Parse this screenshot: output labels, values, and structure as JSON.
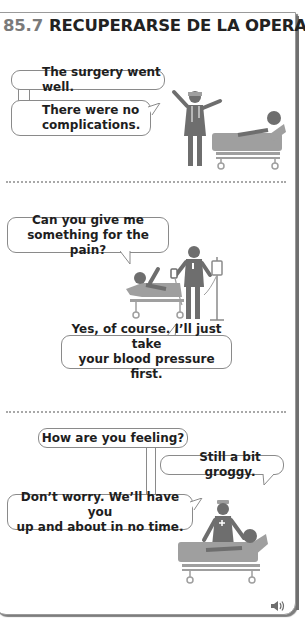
{
  "header": {
    "section_number": "85.7",
    "title": "RECUPERARSE DE LA OPERACIÓN"
  },
  "scenes": [
    {
      "bubbles": [
        {
          "text": "The surgery went well.",
          "speaker": "doctor"
        },
        {
          "text": "There were no complications.",
          "line1": "There were no",
          "line2": "complications.",
          "speaker": "doctor"
        }
      ],
      "illustration": "doctor-and-patient-in-bed"
    },
    {
      "bubbles": [
        {
          "text": "Can you give me something for the pain?",
          "line1": "Can you give me",
          "line2": "something for the pain?",
          "speaker": "patient"
        },
        {
          "text": "Yes, of course. I'll just take your blood pressure first.",
          "line1": "Yes, of course. I’ll just take",
          "line2": "your blood pressure first.",
          "speaker": "nurse"
        }
      ],
      "illustration": "nurse-with-iv-and-patient"
    },
    {
      "bubbles": [
        {
          "text": "How are you feeling?",
          "speaker": "nurse"
        },
        {
          "text": "Still a bit groggy.",
          "speaker": "patient"
        },
        {
          "text": "Don't worry. We'll have you up and about in no time.",
          "line1": "Don’t worry. We’ll have you",
          "line2": "up and about in no time.",
          "speaker": "nurse"
        }
      ],
      "illustration": "nurse-checking-patient"
    }
  ],
  "audio": {
    "icon": "speaker-icon"
  },
  "colors": {
    "figure": "#6e6e6e",
    "figure_light": "#9f9f9f",
    "bubble_border": "#8a8a8a",
    "section_number": "#7a7a7a"
  }
}
